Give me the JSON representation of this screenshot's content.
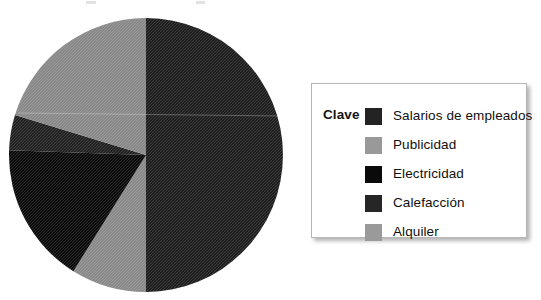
{
  "legend": {
    "title": "Clave",
    "entries": [
      {
        "label": "Salarios de empleados",
        "color": "#232323"
      },
      {
        "label": "Publicidad",
        "color": "#999999"
      },
      {
        "label": "Electricidad",
        "color": "#0a0a0a"
      },
      {
        "label": "Calefacción",
        "color": "#262626"
      },
      {
        "label": "Alquiler",
        "color": "#9a9a9a"
      }
    ]
  },
  "chart_data": {
    "type": "pie",
    "title": "",
    "legend_title": "Clave",
    "legend_position": "right",
    "grid": false,
    "start_angle_deg": 0,
    "direction": "clockwise",
    "center": {
      "x": 146,
      "y": 155
    },
    "radius": 137,
    "labels": [
      "Salarios de empleados",
      "Alquiler",
      "Electricidad",
      "Calefacción",
      "Publicidad"
    ],
    "values": [
      50,
      9,
      17,
      4,
      20
    ],
    "unit": "%",
    "colors": [
      "#232323",
      "#9a9a9a",
      "#0a0a0a",
      "#262626",
      "#999999"
    ],
    "slices": [
      {
        "label": "Salarios de empleados",
        "value": 50,
        "start_deg": 0,
        "end_deg": 180,
        "color": "#232323"
      },
      {
        "label": "Alquiler",
        "value": 9,
        "start_deg": 180,
        "end_deg": 212,
        "color": "#9a9a9a"
      },
      {
        "label": "Electricidad",
        "value": 17,
        "start_deg": 212,
        "end_deg": 272,
        "color": "#0a0a0a"
      },
      {
        "label": "Calefacción",
        "value": 4,
        "start_deg": 272,
        "end_deg": 287,
        "color": "#262626"
      },
      {
        "label": "Publicidad",
        "value": 20,
        "start_deg": 287,
        "end_deg": 360,
        "color": "#999999"
      }
    ]
  }
}
